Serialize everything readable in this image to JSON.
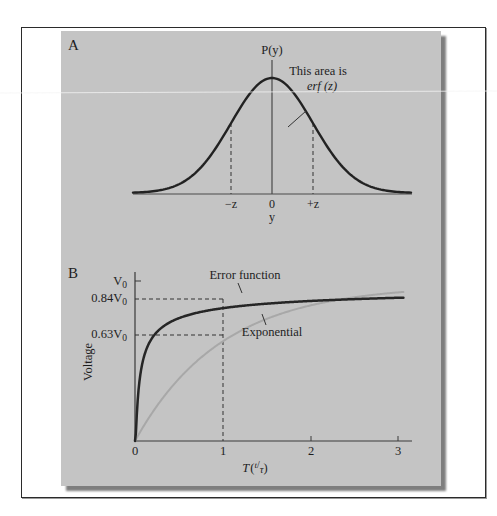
{
  "figure": {
    "panel_background": "#c4c4c4",
    "text_color": "#1e1e1e"
  },
  "chart_data": [
    {
      "type": "line",
      "panel_label": "A",
      "title": "",
      "description": "Gaussian probability density with shaded symmetric interval",
      "ylabel": "P(y)",
      "xlabel": "y",
      "tick_labels": [
        "-z",
        "0",
        "+z"
      ],
      "annotation": {
        "line1": "This area is",
        "line2": "erf (z)"
      },
      "series": [
        {
          "name": "P(y)",
          "function": "gaussian",
          "mean": 0,
          "sigma": 1,
          "color": "#222222"
        }
      ],
      "markers": [
        {
          "label": "-z",
          "x": -1,
          "style": "dashed"
        },
        {
          "label": "+z",
          "x": 1,
          "style": "dashed"
        }
      ],
      "xlim": [
        -3.4,
        3.4
      ],
      "grid": false,
      "legend": "none"
    },
    {
      "type": "line",
      "panel_label": "B",
      "title": "",
      "xlabel": "T(t/τ)",
      "xlabel_main": "T",
      "xlabel_num": "t",
      "xlabel_den": "τ",
      "ylabel": "Voltage",
      "x_ticks": [
        0,
        1,
        2,
        3
      ],
      "x_tick_labels": [
        "0",
        "1",
        "2",
        "3"
      ],
      "y_tick_labels": [
        "V0",
        "0.84V0",
        "0.63V0"
      ],
      "y_tick_values": [
        1.0,
        0.84,
        0.63
      ],
      "xlim": [
        0,
        3.1
      ],
      "ylim": [
        0,
        1.0
      ],
      "grid": false,
      "legend": "inline annotations",
      "series": [
        {
          "name": "Error function",
          "color": "#222222",
          "x": [
            0,
            0.05,
            0.1,
            0.2,
            0.3,
            0.42,
            0.5,
            0.75,
            1.0,
            1.5,
            2.0,
            2.5,
            3.05
          ],
          "values": [
            0,
            0.25,
            0.35,
            0.47,
            0.56,
            0.63,
            0.68,
            0.78,
            0.84,
            0.91,
            0.95,
            0.97,
            0.98
          ]
        },
        {
          "name": "Exponential",
          "color": "#a8a8a8",
          "x": [
            0,
            0.25,
            0.5,
            0.75,
            1.0,
            1.5,
            2.0,
            2.5,
            3.05
          ],
          "values": [
            0,
            0.22,
            0.39,
            0.53,
            0.63,
            0.78,
            0.86,
            0.92,
            0.95
          ]
        }
      ],
      "reference_lines": [
        {
          "from": "x=1",
          "to_y": 0.84,
          "label": "0.84V0",
          "style": "dashed"
        },
        {
          "from": "x=1",
          "to_y": 0.63,
          "label": "0.63V0",
          "style": "dashed"
        }
      ]
    }
  ],
  "panelA": {
    "label": "A",
    "ylabel": "P(y)",
    "xlabel": "y",
    "tick_minus": "−z",
    "tick_zero": "0",
    "tick_plus": "+z",
    "ann_line1": "This area is",
    "ann_line2": "erf (z)"
  },
  "panelB": {
    "label": "B",
    "ylabel": "Voltage",
    "v0_main": "V",
    "v0_sub": "0",
    "v84_main": "0.84V",
    "v84_sub": "0",
    "v63_main": "0.63V",
    "v63_sub": "0",
    "x0": "0",
    "x1": "1",
    "x2": "2",
    "x3": "3",
    "xlabel_main": "T",
    "xlabel_num": "t",
    "xlabel_den": "τ",
    "erf_label": "Error function",
    "exp_label": "Exponential"
  }
}
